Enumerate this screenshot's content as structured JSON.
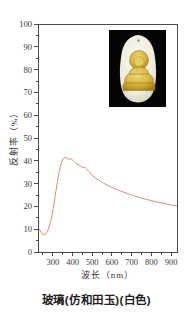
{
  "figure": {
    "ylabel": "反射率（%）",
    "xlabel": "波长（nm）",
    "caption": "玻璃(仿和田玉)(白色)"
  },
  "inset_photo": {
    "description": "white jade-imitation glass pendant with gold seated Buddha on black background"
  },
  "colors": {
    "curve": "#df8b7e",
    "axis": "#4a4a4a",
    "tick_text": "#3a3a3a",
    "caption_text": "#1e1e28",
    "inset_background": "#000000",
    "pendant_ivory": "#f2efe3",
    "buddha_gold": "#d4af37"
  },
  "chart_data": {
    "type": "line",
    "title": "",
    "xlabel": "波长（nm）",
    "ylabel": "反射率（%）",
    "xlim": [
      225,
      930
    ],
    "ylim": [
      0,
      100
    ],
    "xticks": [
      300,
      400,
      500,
      600,
      700,
      800,
      900
    ],
    "yticks": [
      0,
      10,
      20,
      30,
      40,
      50,
      60,
      70,
      80,
      90,
      100
    ],
    "x_minor_ticks": [
      250,
      350,
      450,
      550,
      650,
      750,
      850
    ],
    "y_minor_step": 5,
    "grid": false,
    "legend": "none",
    "line_color": "#df8b7e",
    "series": [
      {
        "x": [
          232,
          240,
          248,
          256,
          264,
          272,
          282,
          292,
          302,
          312,
          322,
          332,
          342,
          352,
          362,
          372,
          382,
          392,
          402,
          412,
          422,
          432,
          442,
          452,
          462,
          472,
          485,
          500,
          520,
          545,
          570,
          600,
          640,
          680,
          720,
          760,
          800,
          840,
          880,
          915,
          928
        ],
        "y": [
          10.0,
          8.6,
          7.8,
          7.6,
          8.0,
          9.0,
          11.0,
          14.5,
          19.0,
          24.5,
          30.0,
          35.0,
          38.8,
          40.8,
          41.5,
          41.2,
          40.6,
          40.9,
          40.2,
          39.3,
          38.6,
          38.3,
          37.6,
          37.0,
          37.2,
          36.4,
          35.2,
          33.6,
          32.3,
          30.8,
          29.6,
          28.3,
          26.9,
          25.6,
          24.4,
          23.4,
          22.5,
          21.7,
          21.0,
          20.4,
          20.2
        ]
      }
    ]
  }
}
